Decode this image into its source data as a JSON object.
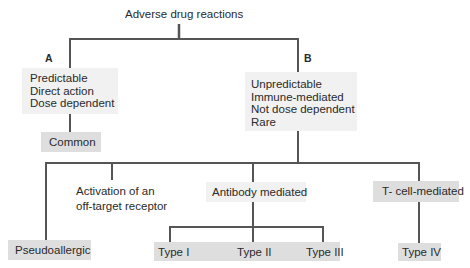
{
  "diagram": {
    "title": "Adverse drug reactions",
    "colors": {
      "line": "#555555",
      "box_gray": "#dedede",
      "box_light": "#f1f1f1",
      "text": "#2a2a2a"
    },
    "branch_a": {
      "label": "A",
      "traits": [
        "Predictable",
        "Direct action",
        "Dose dependent"
      ],
      "frequency": "Common"
    },
    "branch_b": {
      "label": "B",
      "traits": [
        "Unpredictable",
        "Immune-mediated",
        "Not dose dependent",
        "Rare"
      ],
      "children": {
        "pseudoallergic": "Pseudoallergic",
        "activation": [
          "Activation of an",
          "off-target receptor"
        ],
        "antibody": {
          "label": "Antibody mediated",
          "types": [
            "Type I",
            "Type II",
            "Type III"
          ]
        },
        "tcell": {
          "label": "T- cell-mediated",
          "types": [
            "Type IV"
          ]
        }
      }
    }
  }
}
